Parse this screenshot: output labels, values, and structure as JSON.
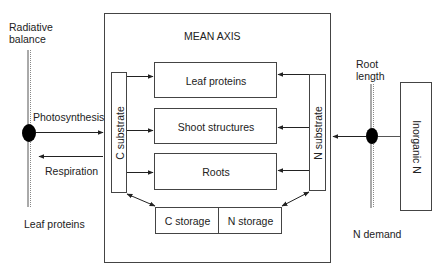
{
  "diagram": {
    "title": "MEAN AXIS",
    "left_driver": {
      "label": "Radiative balance",
      "label_line1": "Radiative",
      "label_line2": "balance",
      "bottom_label": "Leaf proteins",
      "flows": {
        "in_label": "Photosynthesis",
        "out_label": "Respiration"
      }
    },
    "right_driver": {
      "label_line1": "Root",
      "label_line2": "length",
      "bottom_label": "N demand",
      "source_box": "Inorganic N"
    },
    "substrates": {
      "carbon": "C substrate",
      "nitrogen": "N substrate"
    },
    "compartments": [
      {
        "label": "Leaf proteins"
      },
      {
        "label": "Shoot structures"
      },
      {
        "label": "Roots"
      }
    ],
    "storage": {
      "carbon": "C storage",
      "nitrogen": "N storage"
    },
    "colors": {
      "line": "#333333",
      "node": "#000000",
      "background": "#ffffff"
    }
  }
}
